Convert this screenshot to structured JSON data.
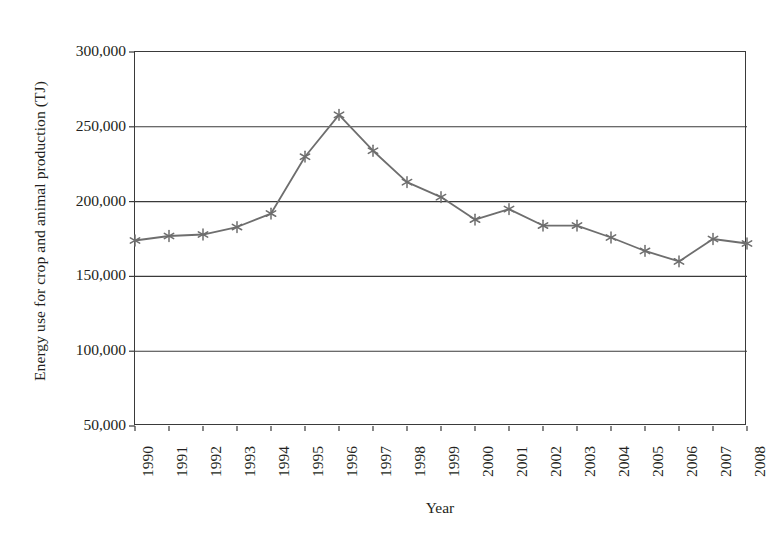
{
  "chart_data": {
    "type": "line",
    "title": "",
    "xlabel": "Year",
    "ylabel": "Energy use for crop and animal production (TJ)",
    "categories": [
      "1990",
      "1991",
      "1992",
      "1993",
      "1994",
      "1995",
      "1996",
      "1997",
      "1998",
      "1999",
      "2000",
      "2001",
      "2002",
      "2003",
      "2004",
      "2005",
      "2006",
      "2007",
      "2008"
    ],
    "values": [
      174000,
      177000,
      178000,
      183000,
      192000,
      230000,
      258000,
      234000,
      213000,
      203000,
      188000,
      195000,
      184000,
      184000,
      176000,
      167000,
      160000,
      175000,
      172000
    ],
    "series": [
      {
        "name": "Energy use for crop and animal production",
        "values": [
          174000,
          177000,
          178000,
          183000,
          192000,
          230000,
          258000,
          234000,
          213000,
          203000,
          188000,
          195000,
          184000,
          184000,
          176000,
          167000,
          160000,
          175000,
          172000
        ],
        "marker": "asterisk",
        "color": "#6e6e6e"
      }
    ],
    "ylim": [
      50000,
      300000
    ],
    "yticks": [
      50000,
      100000,
      150000,
      200000,
      250000,
      300000
    ],
    "ytick_labels": [
      "50,000",
      "100,000",
      "150,000",
      "200,000",
      "250,000",
      "300,000"
    ],
    "grid": "horizontal",
    "legend": "none",
    "line_color": "#6e6e6e",
    "axis_color": "#3a3a3a",
    "background": "#ffffff"
  },
  "axes": {
    "y_title": "Energy use for crop and animal production (TJ)",
    "x_title": "Year"
  }
}
